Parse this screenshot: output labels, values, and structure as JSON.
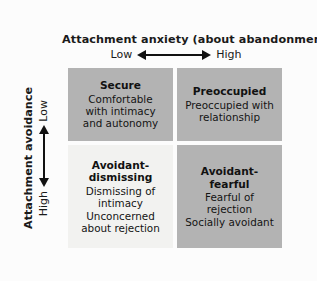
{
  "x_axis": {
    "title": "Attachment anxiety (about abandonment)",
    "low_label": "Low",
    "high_label": "High",
    "arrow": "double-headed-horizontal-arrow"
  },
  "y_axis": {
    "title": "Attachment avoidance",
    "low_label": "Low",
    "high_label": "High",
    "arrow": "double-headed-vertical-arrow"
  },
  "quadrants": [
    {
      "id": "secure",
      "title": "Secure",
      "description": "Comfortable\nwith intimacy\nand autonomy",
      "fill": "#b3b3b3"
    },
    {
      "id": "preoccupied",
      "title": "Preoccupied",
      "description": "Preoccupied with\nrelationship",
      "fill": "#b3b3b3"
    },
    {
      "id": "avoidant-dismissing",
      "title": "Avoidant-\ndismissing",
      "description": "Dismissing of\nintimacy\nUnconcerned\nabout rejection",
      "fill": "#f2f2f0"
    },
    {
      "id": "avoidant-fearful",
      "title": "Avoidant-\nfearful",
      "description": "Fearful of rejection\nSocially avoidant",
      "fill": "#b3b3b3"
    }
  ],
  "colors": {
    "background": "#fcfcfc",
    "shaded_cell": "#b3b3b3",
    "light_cell": "#f2f2f0",
    "shadow": "#a9a9a9",
    "text": "#111111"
  }
}
